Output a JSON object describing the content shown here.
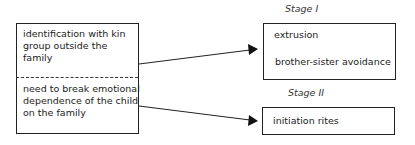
{
  "left_box": {
    "top_text": [
      "identification with kin",
      "group outside the",
      "family"
    ],
    "bottom_text": [
      "need to break emotional",
      "dependence of the child",
      "on the family"
    ]
  },
  "stage1": {
    "label": "Stage I",
    "items": [
      "extrusion",
      "brother-sister avoidance"
    ]
  },
  "stage2": {
    "label": "Stage II",
    "items": [
      "initiation rites"
    ]
  }
}
